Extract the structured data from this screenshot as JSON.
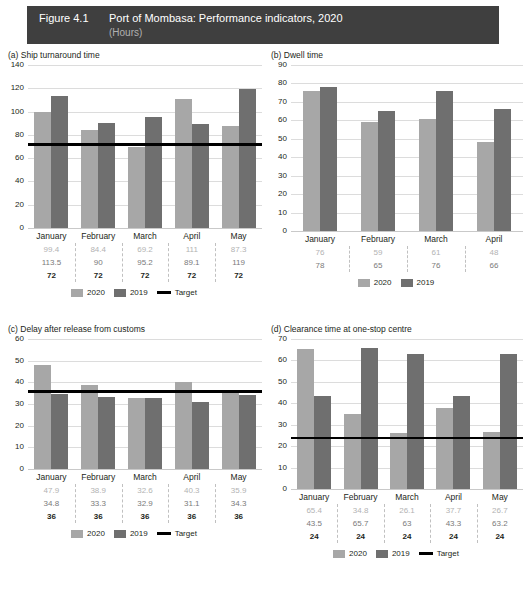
{
  "header": {
    "figure_number": "Figure 4.1",
    "title": "Port of Mombasa: Performance indicators, 2020",
    "subtitle": "(Hours)",
    "bar_color": "#3f3f3f"
  },
  "legend": {
    "s2020": "2020",
    "s2019": "2019",
    "target": "Target",
    "color_2020": "#a7a7a7",
    "color_2019": "#6f6f6f",
    "color_target": "#000000"
  },
  "chart_data": [
    {
      "id": "a",
      "type": "bar",
      "title": "(a) Ship turnaround time",
      "xlabel": "",
      "ylabel": "",
      "ylim": [
        0,
        140
      ],
      "ystep": 20,
      "yticks": [
        0,
        20,
        40,
        60,
        80,
        100,
        120,
        140
      ],
      "grid": true,
      "legend_position": "bottom",
      "categories": [
        "January",
        "February",
        "March",
        "April",
        "May"
      ],
      "series": [
        {
          "name": "2020",
          "values": [
            99.4,
            84.4,
            69.2,
            111,
            87.3
          ],
          "labels": [
            "99.4",
            "84.4",
            "69.2",
            "111",
            "87.3"
          ]
        },
        {
          "name": "2019",
          "values": [
            113.5,
            90,
            95.2,
            89.1,
            119
          ],
          "labels": [
            "113.5",
            "90",
            "95.2",
            "89.1",
            "119"
          ]
        },
        {
          "name": "Target",
          "values": [
            72,
            72,
            72,
            72,
            72
          ],
          "labels": [
            "72",
            "72",
            "72",
            "72",
            "72"
          ]
        }
      ],
      "target": 72,
      "has_target": true
    },
    {
      "id": "b",
      "type": "bar",
      "title": "(b) Dwell time",
      "xlabel": "",
      "ylabel": "",
      "ylim": [
        0,
        90
      ],
      "ystep": 10,
      "yticks": [
        0,
        10,
        20,
        30,
        40,
        50,
        60,
        70,
        80,
        90
      ],
      "grid": true,
      "legend_position": "bottom",
      "categories": [
        "January",
        "February",
        "March",
        "April"
      ],
      "series": [
        {
          "name": "2020",
          "values": [
            76,
            59,
            61,
            48
          ],
          "labels": [
            "76",
            "59",
            "61",
            "48"
          ]
        },
        {
          "name": "2019",
          "values": [
            78,
            65,
            76,
            66
          ],
          "labels": [
            "78",
            "65",
            "76",
            "66"
          ]
        }
      ],
      "target": null,
      "has_target": false
    },
    {
      "id": "c",
      "type": "bar",
      "title": "(c) Delay after release from customs",
      "xlabel": "",
      "ylabel": "",
      "ylim": [
        0,
        60
      ],
      "ystep": 10,
      "yticks": [
        0,
        10,
        20,
        30,
        40,
        50,
        60
      ],
      "grid": true,
      "legend_position": "bottom",
      "categories": [
        "January",
        "February",
        "March",
        "April",
        "May"
      ],
      "series": [
        {
          "name": "2020",
          "values": [
            47.9,
            38.9,
            32.6,
            40.3,
            35.9
          ],
          "labels": [
            "47.9",
            "38.9",
            "32.6",
            "40.3",
            "35.9"
          ]
        },
        {
          "name": "2019",
          "values": [
            34.8,
            33.3,
            32.9,
            31.1,
            34.3
          ],
          "labels": [
            "34.8",
            "33.3",
            "32.9",
            "31.1",
            "34.3"
          ]
        },
        {
          "name": "Target",
          "values": [
            36,
            36,
            36,
            36,
            36
          ],
          "labels": [
            "36",
            "36",
            "36",
            "36",
            "36"
          ]
        }
      ],
      "target": 36,
      "has_target": true
    },
    {
      "id": "d",
      "type": "bar",
      "title": "(d) Clearance time at one-stop centre",
      "xlabel": "",
      "ylabel": "",
      "ylim": [
        0,
        70
      ],
      "ystep": 10,
      "yticks": [
        0,
        10,
        20,
        30,
        40,
        50,
        60,
        70
      ],
      "grid": true,
      "legend_position": "bottom",
      "categories": [
        "January",
        "February",
        "March",
        "April",
        "May"
      ],
      "series": [
        {
          "name": "2020",
          "values": [
            65.4,
            34.8,
            26.1,
            37.7,
            26.7
          ],
          "labels": [
            "65.4",
            "34.8",
            "26.1",
            "37.7",
            "26.7"
          ]
        },
        {
          "name": "2019",
          "values": [
            43.5,
            65.7,
            63,
            43.3,
            63.2
          ],
          "labels": [
            "43.5",
            "65.7",
            "63",
            "43.3",
            "63.2"
          ]
        },
        {
          "name": "Target",
          "values": [
            24,
            24,
            24,
            24,
            24
          ],
          "labels": [
            "24",
            "24",
            "24",
            "24",
            "24"
          ]
        }
      ],
      "target": 24,
      "has_target": true
    }
  ]
}
